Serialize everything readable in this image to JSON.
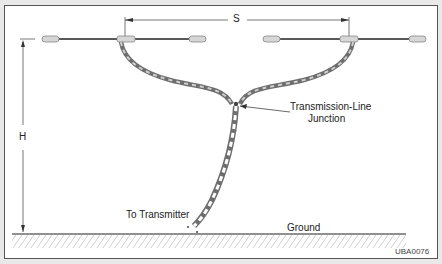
{
  "diagram": {
    "labels": {
      "spacing": "S",
      "height": "H",
      "junction_line1": "Transmission-Line",
      "junction_line2": "Junction",
      "feed": "To Transmitter",
      "ground": "Ground",
      "figure_id": "UBA0076"
    },
    "colors": {
      "line": "#222222",
      "ladder": "#6e6e6e",
      "ladder_fill": "#bdbdbd",
      "insulator": "#cfcfcf",
      "frame": "#555555"
    }
  }
}
